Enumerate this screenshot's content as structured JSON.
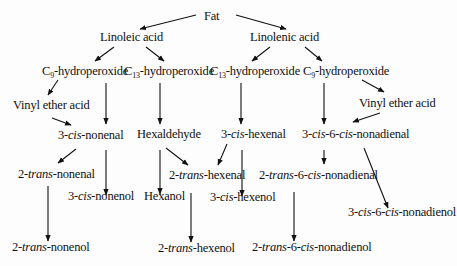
{
  "diagram": {
    "nodes": {
      "fat": "Fat",
      "linoleic_acid": "Linoleic acid",
      "linolenic_acid": "Linolenic acid",
      "c9_hydroperoxide_left": {
        "prefix": "C",
        "sub": "9",
        "suffix": "-hydroperoxide"
      },
      "c13_hydroperoxide_left": {
        "prefix": "C",
        "sub": "13",
        "suffix": "-hydroperoxide"
      },
      "c13_hydroperoxide_right": {
        "prefix": "C",
        "sub": "13",
        "suffix": "-hydroperoxide"
      },
      "c9_hydroperoxide_right": {
        "prefix": "C",
        "sub": "9",
        "suffix": "-hydroperoxide"
      },
      "vinyl_ether_acid_left": "Vinyl ether acid",
      "vinyl_ether_acid_right": "Vinyl ether acid",
      "three_cis_nonenal": {
        "a": "3-",
        "b": "cis",
        "c": "-nonenal"
      },
      "hexaldehyde": "Hexaldehyde",
      "three_cis_hexenal": {
        "a": "3-",
        "b": "cis",
        "c": "-hexenal"
      },
      "three_cis_six_cis_nonadienal": {
        "a": "3-",
        "b": "cis",
        "c": "-6-",
        "d": "cis",
        "e": "-nonadienal"
      },
      "two_trans_nonenal": {
        "a": "2-",
        "b": "trans",
        "c": "-nonenal"
      },
      "three_cis_nonenol": {
        "a": "3-",
        "b": "cis",
        "c": "-nonenol"
      },
      "two_trans_hexenal": {
        "a": "2-",
        "b": "trans",
        "c": "-hexenal"
      },
      "hexanol": "Hexanol",
      "three_cis_hexenol": {
        "a": "3-",
        "b": "cis",
        "c": "-hexenol"
      },
      "two_trans_six_cis_nonadienal": {
        "a": "2-",
        "b": "trans",
        "c": "-6-",
        "d": "cis",
        "e": "-nonadienal"
      },
      "three_cis_six_cis_nonadienol": {
        "a": "3-",
        "b": "cis",
        "c": "-6-",
        "d": "cis",
        "e": "-nonadienol"
      },
      "two_trans_nonenol": {
        "a": "2-",
        "b": "trans",
        "c": "-nonenol"
      },
      "two_trans_hexenol": {
        "a": "2-",
        "b": "trans",
        "c": "-hexenol"
      },
      "two_trans_six_cis_nonadienol": {
        "a": "2-",
        "b": "trans",
        "c": "-6-",
        "d": "cis",
        "e": "-nonadienol"
      }
    },
    "edges": [
      [
        "Fat",
        "Linoleic acid"
      ],
      [
        "Fat",
        "Linolenic acid"
      ],
      [
        "Linoleic acid",
        "C9-hydroperoxide"
      ],
      [
        "Linoleic acid",
        "C13-hydroperoxide"
      ],
      [
        "Linolenic acid",
        "C13-hydroperoxide"
      ],
      [
        "Linolenic acid",
        "C9-hydroperoxide"
      ],
      [
        "C9-hydroperoxide",
        "Vinyl ether acid"
      ],
      [
        "C9-hydroperoxide",
        "3-cis-nonenal"
      ],
      [
        "Vinyl ether acid",
        "3-cis-nonenal"
      ],
      [
        "C13-hydroperoxide",
        "Hexaldehyde"
      ],
      [
        "C13-hydroperoxide",
        "3-cis-hexenal"
      ],
      [
        "C9-hydroperoxide",
        "3-cis-6-cis-nonadienal"
      ],
      [
        "C9-hydroperoxide",
        "Vinyl ether acid"
      ],
      [
        "Vinyl ether acid",
        "3-cis-6-cis-nonadienal"
      ],
      [
        "3-cis-nonenal",
        "2-trans-nonenal"
      ],
      [
        "3-cis-nonenal",
        "3-cis-nonenol"
      ],
      [
        "Hexaldehyde",
        "2-trans-hexenal"
      ],
      [
        "Hexaldehyde",
        "Hexanol"
      ],
      [
        "3-cis-hexenal",
        "2-trans-hexenal"
      ],
      [
        "3-cis-hexenal",
        "3-cis-hexenol"
      ],
      [
        "3-cis-6-cis-nonadienal",
        "2-trans-6-cis-nonadienal"
      ],
      [
        "3-cis-6-cis-nonadienal",
        "3-cis-6-cis-nonadienol"
      ],
      [
        "2-trans-nonenal",
        "2-trans-nonenol"
      ],
      [
        "2-trans-hexenal",
        "2-trans-hexenol"
      ],
      [
        "2-trans-6-cis-nonadienal",
        "2-trans-6-cis-nonadienol"
      ]
    ],
    "colors": {
      "background": "#fdfdfd",
      "ink": "#111111"
    }
  }
}
